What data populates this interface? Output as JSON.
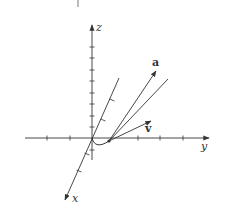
{
  "figure": {
    "type": "3d-axes-vector-diagram",
    "axes": {
      "x": {
        "label": "x"
      },
      "y": {
        "label": "y"
      },
      "z": {
        "label": "z"
      }
    },
    "vectors": [
      {
        "label": "a",
        "style": "bold"
      },
      {
        "label": "v",
        "style": "bold"
      }
    ],
    "colors": {
      "stroke": "#333333",
      "background": "#ffffff"
    }
  }
}
